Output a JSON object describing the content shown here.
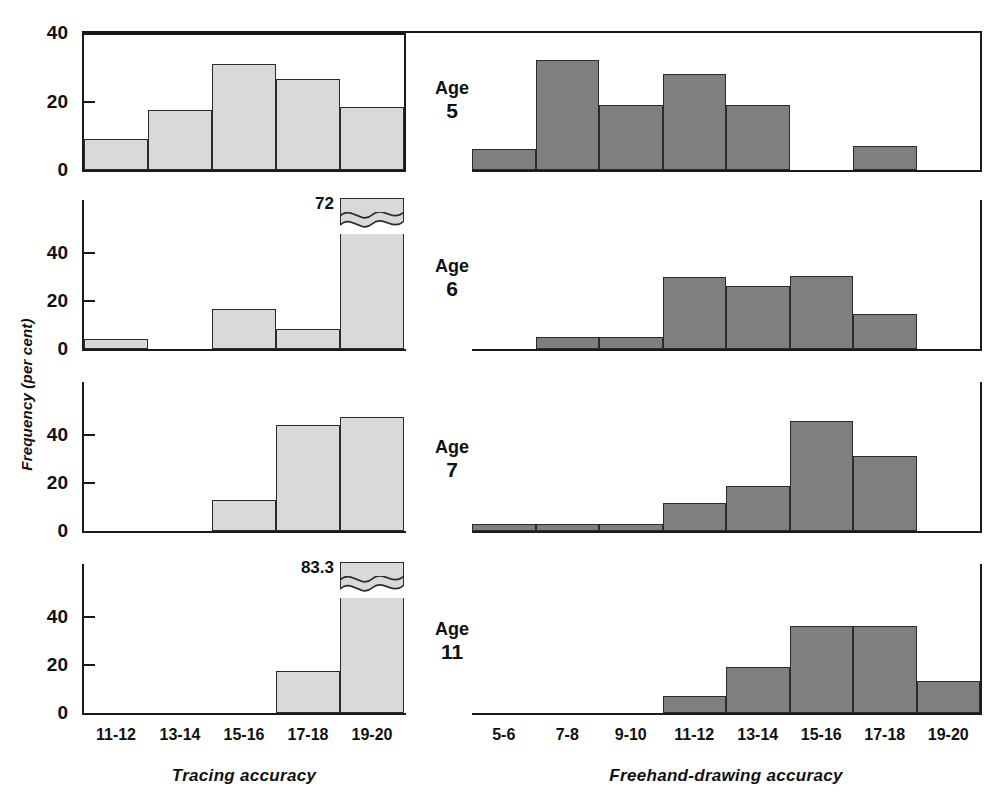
{
  "figure": {
    "ylabel": "Frequency (per cent)",
    "colors": {
      "tracing_fill": "#d9d9d9",
      "freehand_fill": "#7f7f7f",
      "outline": "#2b2b2b",
      "text": "#111111",
      "background": "#ffffff"
    }
  },
  "left_group": {
    "xtitle": "Tracing accuracy",
    "categories": [
      "11-12",
      "13-14",
      "15-16",
      "17-18",
      "19-20"
    ],
    "yticks_row1": [
      "0",
      "20",
      "40"
    ],
    "yticks_other": [
      "0",
      "20",
      "40"
    ]
  },
  "right_group": {
    "xtitle": "Freehand-drawing accuracy",
    "categories": [
      "5-6",
      "7-8",
      "9-10",
      "11-12",
      "13-14",
      "15-16",
      "17-18",
      "19-20"
    ]
  },
  "rows": [
    {
      "age_word": "Age",
      "age_number": "5",
      "left": {
        "values": [
          9,
          17.5,
          31,
          26.5,
          18.5
        ],
        "ymax": 40,
        "yticks": [
          0,
          20,
          40
        ],
        "truncated_index": null,
        "truncated_label": null
      },
      "right": {
        "values": [
          6,
          32,
          19,
          28,
          19,
          0,
          7,
          0
        ],
        "ymax": 40,
        "truncated_index": null,
        "truncated_label": null
      }
    },
    {
      "age_word": "Age",
      "age_number": "6",
      "left": {
        "values": [
          4,
          0,
          16.5,
          8.5,
          72
        ],
        "ymax": 56,
        "yticks": [
          0,
          20,
          40
        ],
        "truncated_index": 4,
        "truncated_label": "72"
      },
      "right": {
        "values": [
          0,
          5,
          5,
          30,
          26,
          30.5,
          14.5,
          0
        ],
        "ymax": 56,
        "truncated_index": null,
        "truncated_label": null
      }
    },
    {
      "age_word": "Age",
      "age_number": "7",
      "left": {
        "values": [
          0,
          0,
          13,
          44,
          47.5
        ],
        "ymax": 56,
        "yticks": [
          0,
          20,
          40
        ],
        "truncated_index": null,
        "truncated_label": null
      },
      "right": {
        "values": [
          3,
          3,
          3,
          11.5,
          18.5,
          45.5,
          31,
          0
        ],
        "ymax": 56,
        "truncated_index": null,
        "truncated_label": null
      }
    },
    {
      "age_word": "Age",
      "age_number": "11",
      "left": {
        "values": [
          0,
          0,
          0,
          17.5,
          83.3
        ],
        "ymax": 56,
        "yticks": [
          0,
          20,
          40
        ],
        "truncated_index": 4,
        "truncated_label": "83.3"
      },
      "right": {
        "values": [
          0,
          0,
          0,
          7,
          19,
          36,
          36,
          13.5
        ],
        "ymax": 56,
        "truncated_index": null,
        "truncated_label": null
      }
    }
  ],
  "chart_data": {
    "type": "bar",
    "title": "",
    "subtitle": "",
    "ylabel": "Frequency (per cent)",
    "grid": false,
    "legend": "none",
    "panels": [
      {
        "name": "Age 5 - Tracing accuracy",
        "xlabel": "Tracing accuracy",
        "ylabel": "Frequency (per cent)",
        "ylim": [
          0,
          40
        ],
        "yticks": [
          0,
          20,
          40
        ],
        "categories": [
          "11-12",
          "13-14",
          "15-16",
          "17-18",
          "19-20"
        ],
        "values": [
          9,
          17.5,
          31,
          26.5,
          18.5
        ]
      },
      {
        "name": "Age 5 - Freehand-drawing accuracy",
        "xlabel": "Freehand-drawing accuracy",
        "ylabel": "Frequency (per cent)",
        "ylim": [
          0,
          40
        ],
        "categories": [
          "5-6",
          "7-8",
          "9-10",
          "11-12",
          "13-14",
          "15-16",
          "17-18",
          "19-20"
        ],
        "values": [
          6,
          32,
          19,
          28,
          19,
          0,
          7,
          0
        ]
      },
      {
        "name": "Age 6 - Tracing accuracy",
        "xlabel": "Tracing accuracy",
        "ylabel": "Frequency (per cent)",
        "ylim": [
          0,
          56
        ],
        "yticks": [
          0,
          20,
          40
        ],
        "categories": [
          "11-12",
          "13-14",
          "15-16",
          "17-18",
          "19-20"
        ],
        "values": [
          4,
          0,
          16.5,
          8.5,
          72
        ],
        "annotations": [
          {
            "category": "19-20",
            "text": "72",
            "note": "bar truncated with axis break"
          }
        ]
      },
      {
        "name": "Age 6 - Freehand-drawing accuracy",
        "xlabel": "Freehand-drawing accuracy",
        "ylabel": "Frequency (per cent)",
        "ylim": [
          0,
          56
        ],
        "categories": [
          "5-6",
          "7-8",
          "9-10",
          "11-12",
          "13-14",
          "15-16",
          "17-18",
          "19-20"
        ],
        "values": [
          0,
          5,
          5,
          30,
          26,
          30.5,
          14.5,
          0
        ]
      },
      {
        "name": "Age 7 - Tracing accuracy",
        "xlabel": "Tracing accuracy",
        "ylabel": "Frequency (per cent)",
        "ylim": [
          0,
          56
        ],
        "yticks": [
          0,
          20,
          40
        ],
        "categories": [
          "11-12",
          "13-14",
          "15-16",
          "17-18",
          "19-20"
        ],
        "values": [
          0,
          0,
          13,
          44,
          47.5
        ]
      },
      {
        "name": "Age 7 - Freehand-drawing accuracy",
        "xlabel": "Freehand-drawing accuracy",
        "ylabel": "Frequency (per cent)",
        "ylim": [
          0,
          56
        ],
        "categories": [
          "5-6",
          "7-8",
          "9-10",
          "11-12",
          "13-14",
          "15-16",
          "17-18",
          "19-20"
        ],
        "values": [
          3,
          3,
          3,
          11.5,
          18.5,
          45.5,
          31,
          0
        ]
      },
      {
        "name": "Age 11 - Tracing accuracy",
        "xlabel": "Tracing accuracy",
        "ylabel": "Frequency (per cent)",
        "ylim": [
          0,
          56
        ],
        "yticks": [
          0,
          20,
          40
        ],
        "categories": [
          "11-12",
          "13-14",
          "15-16",
          "17-18",
          "19-20"
        ],
        "values": [
          0,
          0,
          0,
          17.5,
          83.3
        ],
        "annotations": [
          {
            "category": "19-20",
            "text": "83.3",
            "note": "bar truncated with axis break"
          }
        ]
      },
      {
        "name": "Age 11 - Freehand-drawing accuracy",
        "xlabel": "Freehand-drawing accuracy",
        "ylabel": "Frequency (per cent)",
        "ylim": [
          0,
          56
        ],
        "categories": [
          "5-6",
          "7-8",
          "9-10",
          "11-12",
          "13-14",
          "15-16",
          "17-18",
          "19-20"
        ],
        "values": [
          0,
          0,
          0,
          7,
          19,
          36,
          36,
          13.5
        ]
      }
    ]
  }
}
